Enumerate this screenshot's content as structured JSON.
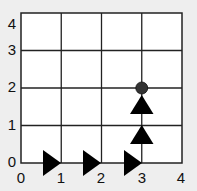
{
  "diagram": {
    "type": "grid-path",
    "grid": {
      "x_min": 0,
      "x_max": 4,
      "y_min": 0,
      "y_max": 4
    },
    "x_ticks": [
      "0",
      "1",
      "2",
      "3",
      "4"
    ],
    "y_ticks": [
      "0",
      "1",
      "2",
      "3",
      "4"
    ],
    "path_arrows": [
      {
        "x": 1,
        "y": 0,
        "direction": "right"
      },
      {
        "x": 2,
        "y": 0,
        "direction": "right"
      },
      {
        "x": 3,
        "y": 0,
        "direction": "right"
      },
      {
        "x": 3,
        "y": 1,
        "direction": "up"
      },
      {
        "x": 3,
        "y": 2,
        "direction": "up"
      }
    ],
    "endpoint": {
      "x": 3,
      "y": 2,
      "shape": "circle",
      "color": "#333333"
    },
    "colors": {
      "background": "#eeeeee",
      "grid_fill": "#ffffff",
      "line": "#222222",
      "arrow": "#000000"
    }
  }
}
